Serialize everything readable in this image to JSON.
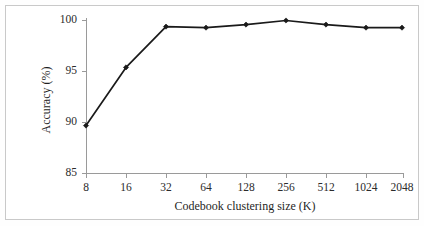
{
  "chart_data": {
    "type": "line",
    "title": "",
    "xlabel": "Codebook clustering size (K)",
    "ylabel": "Accuracy (%)",
    "categories": [
      "8",
      "16",
      "32",
      "64",
      "128",
      "256",
      "512",
      "1024",
      "2048"
    ],
    "values": [
      89.7,
      95.4,
      99.4,
      99.3,
      99.6,
      100.0,
      99.6,
      99.3,
      99.3
    ],
    "series": [
      {
        "name": "Accuracy",
        "values": [
          89.7,
          95.4,
          99.4,
          99.3,
          99.6,
          100.0,
          99.6,
          99.3,
          99.3
        ],
        "color": "#1a1a1a",
        "marker": "diamond"
      }
    ],
    "ylim": [
      85,
      100
    ],
    "yticks": [
      85,
      90,
      95,
      100
    ],
    "ytick_labels": [
      "85",
      "90",
      "95",
      "100"
    ],
    "xtick_labels": [
      "8",
      "16",
      "32",
      "64",
      "128",
      "256",
      "512",
      "1024",
      "2048"
    ],
    "grid": false,
    "legend": "none",
    "xscale": "categorical",
    "annotations": []
  },
  "figure": {
    "border_color": "#c9c9c9",
    "background": "#ffffff",
    "axis_color": "#9a9a9a",
    "line_color": "#1a1a1a"
  }
}
